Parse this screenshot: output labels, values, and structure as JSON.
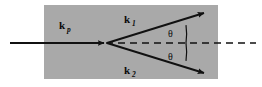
{
  "figure": {
    "name": "scattering-wavevector-diagram",
    "canvas": {
      "width": 262,
      "height": 87
    },
    "colors": {
      "medium_fill": "#a9a9a9",
      "background": "#ffffff",
      "stroke": "#111111",
      "axis_dash": "#111111"
    },
    "medium_region": {
      "label": "scattering-medium",
      "x": 44,
      "y": 5,
      "width": 174,
      "height": 74
    },
    "vertex": {
      "x": 106,
      "y": 43
    },
    "vectors": [
      {
        "id": "incident",
        "symbol": "k",
        "subscript": "p",
        "label": "k_p",
        "from": {
          "x": 10,
          "y": 43
        },
        "to": {
          "x": 106,
          "y": 43
        },
        "label_pos": {
          "x": 63,
          "y": 28
        }
      },
      {
        "id": "scattered-upper",
        "symbol": "k",
        "subscript": "1",
        "label": "k_1",
        "from": {
          "x": 106,
          "y": 43
        },
        "to": {
          "x": 206,
          "y": 12
        },
        "label_pos": {
          "x": 128,
          "y": 22
        }
      },
      {
        "id": "scattered-lower",
        "symbol": "k",
        "subscript": "2",
        "label": "k_2",
        "from": {
          "x": 106,
          "y": 43
        },
        "to": {
          "x": 206,
          "y": 74
        },
        "label_pos": {
          "x": 128,
          "y": 74
        }
      }
    ],
    "axis": {
      "id": "optical-axis",
      "style": "dashed",
      "from": {
        "x": 106,
        "y": 43
      },
      "to": {
        "x": 256,
        "y": 43
      }
    },
    "angles": [
      {
        "id": "theta-upper",
        "label": "θ",
        "between": [
          "optical-axis",
          "scattered-upper"
        ],
        "label_pos": {
          "x": 172,
          "y": 36
        },
        "arc_radius": 62
      },
      {
        "id": "theta-lower",
        "label": "θ",
        "between": [
          "optical-axis",
          "scattered-lower"
        ],
        "label_pos": {
          "x": 172,
          "y": 58
        },
        "arc_radius": 62
      }
    ]
  }
}
